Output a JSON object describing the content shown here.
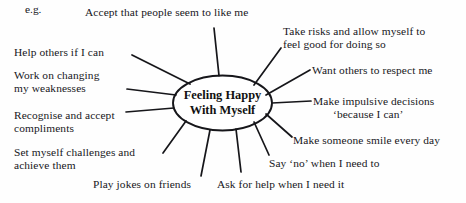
{
  "diagram": {
    "kind": "sunburst-spider-diagram",
    "example_marker": "e.g.",
    "center": {
      "line1": "Feeling Happy",
      "line2": "With Myself"
    },
    "colors": {
      "stroke": "#16161a",
      "text": "#17171c",
      "background": "#fefefe"
    },
    "branches": [
      {
        "id": "accept-liked",
        "text": "Accept that people seem to like me"
      },
      {
        "id": "take-risks-line1",
        "text": "Take risks and allow myself to"
      },
      {
        "id": "take-risks-line2",
        "text": "feel good for doing so"
      },
      {
        "id": "want-respect",
        "text": "Want others to respect me"
      },
      {
        "id": "impulsive-line1",
        "text": "Make impulsive decisions"
      },
      {
        "id": "impulsive-line2",
        "text": "‘because I can’"
      },
      {
        "id": "make-smile",
        "text": "Make someone smile every day"
      },
      {
        "id": "say-no",
        "text": "Say ‘no’ when I need to"
      },
      {
        "id": "ask-for-help",
        "text": "Ask for help when I need it"
      },
      {
        "id": "play-jokes",
        "text": "Play jokes on friends"
      },
      {
        "id": "set-challenges-line1",
        "text": "Set myself challenges and"
      },
      {
        "id": "set-challenges-line2",
        "text": "achieve them"
      },
      {
        "id": "recognise-line1",
        "text": "Recognise and accept"
      },
      {
        "id": "recognise-line2",
        "text": "compliments"
      },
      {
        "id": "work-changing-line1",
        "text": "Work on changing"
      },
      {
        "id": "work-changing-line2",
        "text": "my weaknesses"
      },
      {
        "id": "help-others",
        "text": "Help others if I can"
      }
    ]
  }
}
